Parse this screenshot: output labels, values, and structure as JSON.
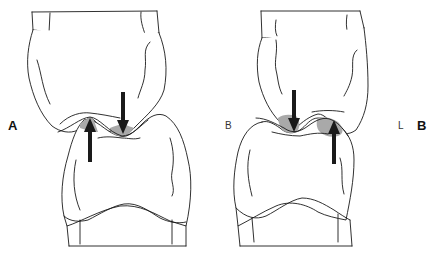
{
  "figure": {
    "panels": [
      {
        "id": "A",
        "label": "A",
        "arrows": [
          {
            "direction": "down",
            "position": "lower-molar-fossa"
          },
          {
            "direction": "up",
            "position": "upper-tooth-fossa"
          }
        ]
      },
      {
        "id": "B",
        "label": "B",
        "side_labels": {
          "left": "B",
          "right": "L"
        },
        "arrows": [
          {
            "direction": "down",
            "position": "left-contact"
          },
          {
            "direction": "up",
            "position": "right-contact"
          }
        ]
      }
    ],
    "colors": {
      "outline": "#1a1a1a",
      "contact_shading": "#a9a9a9",
      "arrow": "#1a1a1a",
      "background": "#ffffff"
    }
  }
}
